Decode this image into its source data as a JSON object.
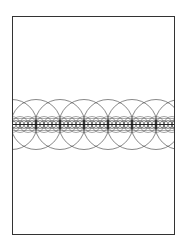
{
  "figure": {
    "frame": {
      "x": 12.5,
      "y": 16.5,
      "width": 162,
      "height": 218,
      "stroke": "#333333"
    },
    "band_center_y": 124.5,
    "circle_sets": [
      {
        "name": "large",
        "radius": 25,
        "spacing": 24,
        "start_x": 12,
        "count": 8,
        "stroke": "#555555"
      },
      {
        "name": "medium",
        "radius": 8,
        "spacing": 8,
        "start_x": 12,
        "count": 22,
        "stroke": "#666666"
      },
      {
        "name": "small",
        "radius": 4,
        "spacing": 4,
        "start_x": 12,
        "count": 42,
        "stroke": "#444444"
      }
    ],
    "guide_lines": [
      {
        "y_offset": -6,
        "stroke": "#777777"
      },
      {
        "y_offset": 6,
        "stroke": "#777777"
      }
    ],
    "center_line": {
      "stroke": "#222222"
    }
  }
}
